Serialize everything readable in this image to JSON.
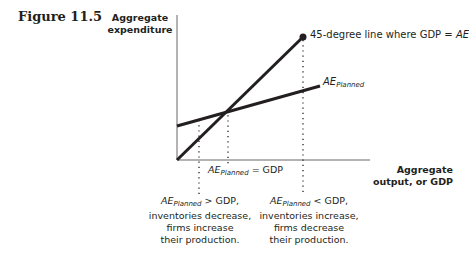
{
  "figure": {
    "label": "Figure 11.5"
  },
  "axes": {
    "y_label_line1": "Aggregate",
    "y_label_line2": "expenditure",
    "x_label_line1": "Aggregate",
    "x_label_line2": "output, or GDP"
  },
  "lines": {
    "forty_five": {
      "label_prefix": "45-degree line where GDP = ",
      "label_italic": "AE",
      "color": "#231f20"
    },
    "ae_planned": {
      "label_main": "AE",
      "label_sub": "Planned",
      "color": "#231f20"
    }
  },
  "equilibrium": {
    "label_main": "AE",
    "label_sub": "Planned",
    "label_rest": " = GDP"
  },
  "notes": {
    "left": {
      "main": "AE",
      "sub": "Planned",
      "rel": " > GDP,",
      "line2": "inventories decrease,",
      "line3": "firms increase",
      "line4": "their production."
    },
    "right": {
      "main": "AE",
      "sub": "Planned",
      "rel": " < GDP,",
      "line2": "inventories increase,",
      "line3": "firms decrease",
      "line4": "their production."
    }
  }
}
